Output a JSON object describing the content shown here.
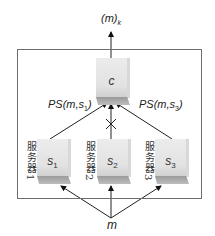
{
  "diagram": {
    "output_label": {
      "base": "(m)",
      "sub": "k"
    },
    "combiner": {
      "label": "c"
    },
    "edge_labels": {
      "left": {
        "text": "PS(m,s",
        "sub": "1",
        "close": ")"
      },
      "right": {
        "text": "PS(m,s",
        "sub": "3",
        "close": ")"
      }
    },
    "servers": [
      {
        "name": "服务器1",
        "label": "s",
        "sub": "1"
      },
      {
        "name": "服务器2",
        "label": "s",
        "sub": "2"
      },
      {
        "name": "服务器3",
        "label": "s",
        "sub": "3"
      }
    ],
    "blocked_edge": "s2 → c (×)",
    "input_label": "m",
    "colors": {
      "frame": "#6d6d6d",
      "line": "#222222",
      "block": "#e6e6e6",
      "block_shadow": "#a8a8a8"
    }
  }
}
